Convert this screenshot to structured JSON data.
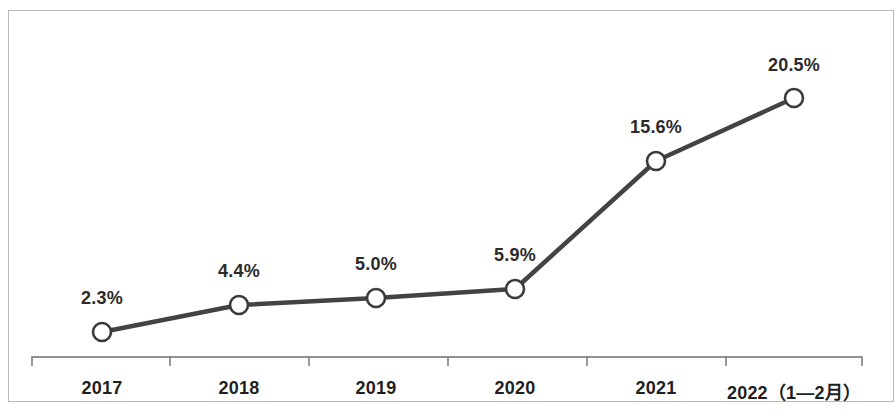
{
  "chart_data": {
    "type": "line",
    "title": "",
    "subtitle": "",
    "xlabel": "",
    "ylabel": "",
    "categories": [
      "2017",
      "2018",
      "2019",
      "2020",
      "2021",
      "2022（1—2月）"
    ],
    "values": [
      2.3,
      4.4,
      5.0,
      5.9,
      15.6,
      20.5
    ],
    "value_labels": [
      "2.3%",
      "4.4%",
      "5.0%",
      "5.9%",
      "15.6%",
      "20.5%"
    ],
    "series": [
      {
        "name": "",
        "values": [
          2.3,
          4.4,
          5.0,
          5.9,
          15.6,
          20.5
        ]
      }
    ],
    "unit": "%",
    "ylim": [
      0,
      23.5
    ],
    "grid": false,
    "legend": false,
    "legend_position": "none",
    "axis": {
      "x_axis_visible": true,
      "y_axis_visible": false,
      "tick_style": "between-categories"
    },
    "style": {
      "line_color": "#434343",
      "line_width_px": 4.5,
      "marker_shape": "circle",
      "marker_fill": "#ffffff",
      "marker_stroke": "#3a3a3a",
      "marker_radius_px": 9,
      "label_color": "#2b2b2b",
      "axis_color": "#6f6f6f",
      "frame_color": "#b9b9b9",
      "background": "#ffffff"
    },
    "points": [
      {
        "category": "2017",
        "label": "2.3%",
        "value": 2.3,
        "x": 102,
        "y": 332
      },
      {
        "category": "2018",
        "label": "4.4%",
        "value": 4.4,
        "x": 239,
        "y": 305
      },
      {
        "category": "2019",
        "label": "5.0%",
        "value": 5.0,
        "x": 376,
        "y": 298
      },
      {
        "category": "2020",
        "label": "5.9%",
        "value": 5.9,
        "x": 515,
        "y": 289
      },
      {
        "category": "2021",
        "label": "15.6%",
        "value": 15.6,
        "x": 656,
        "y": 161
      },
      {
        "category": "2022（1—2月）",
        "label": "20.5%",
        "value": 20.5,
        "x": 794,
        "y": 98
      }
    ],
    "label_positions": [
      {
        "x": 102,
        "y": 288
      },
      {
        "x": 239,
        "y": 261
      },
      {
        "x": 376,
        "y": 254
      },
      {
        "x": 515,
        "y": 245
      },
      {
        "x": 656,
        "y": 117
      },
      {
        "x": 794,
        "y": 55
      }
    ],
    "tick_label_positions": [
      102,
      239,
      376,
      515,
      656,
      794
    ],
    "axis_line": {
      "x_start": 32,
      "x_end": 862,
      "y": 357,
      "tick_length": 9,
      "tick_x": [
        32,
        170,
        309,
        448,
        587,
        726,
        862
      ]
    }
  }
}
